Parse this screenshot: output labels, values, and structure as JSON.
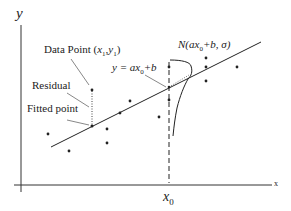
{
  "diagram": {
    "axes": {
      "y_label": "y",
      "x_label": "x",
      "x0_label": "x0"
    },
    "annotations": {
      "data_point": "Data Point (x1,y1)",
      "residual": "Residual",
      "fitted_point": "Fitted point",
      "line_equation": "y = ax0+b",
      "distribution": "N(ax0+b, σ)"
    },
    "fitted_line": {
      "x1": 51,
      "y1": 147,
      "x2": 261,
      "y2": 42
    },
    "data_points": [
      {
        "x": 92,
        "y": 90
      },
      {
        "x": 48,
        "y": 134
      },
      {
        "x": 69,
        "y": 151
      },
      {
        "x": 107,
        "y": 129
      },
      {
        "x": 107,
        "y": 143
      },
      {
        "x": 120,
        "y": 113
      },
      {
        "x": 130,
        "y": 101
      },
      {
        "x": 159,
        "y": 117
      },
      {
        "x": 169,
        "y": 67
      },
      {
        "x": 169,
        "y": 100
      },
      {
        "x": 206,
        "y": 58
      },
      {
        "x": 206,
        "y": 67
      },
      {
        "x": 206,
        "y": 81
      },
      {
        "x": 237,
        "y": 67
      }
    ],
    "colors": {
      "line": "#222222",
      "background": "#ffffff"
    }
  }
}
